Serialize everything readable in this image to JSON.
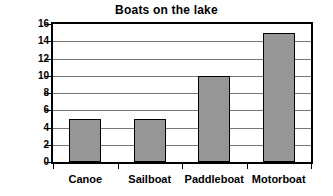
{
  "chart_data": {
    "type": "bar",
    "title": "Boats on the lake",
    "xlabel": "",
    "ylabel": "# of boats",
    "categories": [
      "Canoe",
      "Sailboat",
      "Paddleboat",
      "Motorboat"
    ],
    "values": [
      5,
      5,
      10,
      15
    ],
    "ylim": [
      0,
      16
    ],
    "ytick_step": 2,
    "yticks": [
      16,
      14,
      12,
      10,
      8,
      6,
      4,
      2,
      0
    ],
    "grid": true,
    "legend": false,
    "series": [
      {
        "name": "# of boats",
        "values": [
          5,
          5,
          10,
          15
        ]
      }
    ],
    "colors": {
      "bar_fill": "#969696",
      "bar_border": "#000000",
      "gridline": "#767676",
      "axis": "#000000",
      "background": "#ffffff",
      "text": "#000000"
    }
  }
}
